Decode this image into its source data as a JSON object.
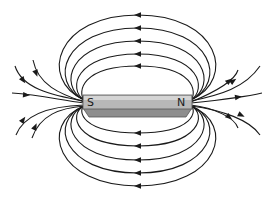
{
  "diagram": {
    "magnet": {
      "south_label": "S",
      "north_label": "N",
      "colors": {
        "face": "#b8b8b8",
        "top_light": "#d4d4d4",
        "underside": "#8e8e8e",
        "edge": "#555555"
      }
    },
    "field_lines": {
      "closed_loops_above": 5,
      "closed_loops_below": 5,
      "open_lines_per_end": 5,
      "direction": "out of N, into S",
      "color": "#1a1a1a"
    }
  }
}
